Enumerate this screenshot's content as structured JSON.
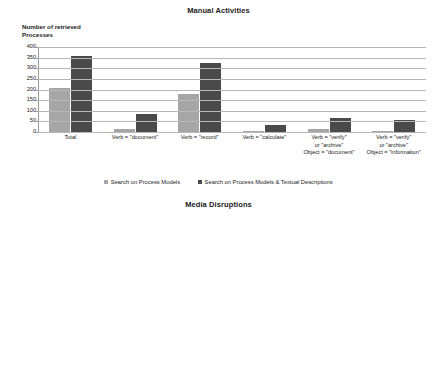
{
  "charts": [
    {
      "title": "Manual Activities",
      "y_caption": "Number of retrieved\nProcesses",
      "legend": [
        "Search on Process Models",
        "Search on Process Models & Textual Descriptions"
      ]
    },
    {
      "title": "Media Disruptions",
      "y_caption": "Number of retrieved\nProcesses",
      "legend": [
        "Search on Process Models",
        "Search on Process Models & Textual Descriptions"
      ]
    }
  ],
  "chart_data": [
    {
      "type": "bar",
      "title": "Manual Activities",
      "xlabel": "",
      "ylabel": "Number of retrieved Processes",
      "ylim": [
        0,
        400
      ],
      "yticks": [
        0,
        50,
        100,
        150,
        200,
        250,
        300,
        350,
        400
      ],
      "grid": true,
      "legend_position": "bottom",
      "categories": [
        "Total",
        "Verb = \"document\"",
        "Verb = \"record\"",
        "Verb = \"calculate\"",
        "Verb = \"verify\"\nor \"archive\"\nObject = \"document\"",
        "Verb = \"verify\"\nor \"archive\"\nObject = \"information\""
      ],
      "series": [
        {
          "name": "Search on Process Models",
          "color": "#a6a6a6",
          "values": [
            207,
            14,
            180,
            1,
            16,
            2
          ]
        },
        {
          "name": "Search on Process Models & Textual Descriptions",
          "color": "#4a4a4a",
          "values": [
            360,
            85,
            325,
            33,
            68,
            55
          ]
        }
      ]
    },
    {
      "type": "bar",
      "title": "Media Disruptions",
      "xlabel": "",
      "ylabel": "Number of retrieved Processes",
      "ylim": [
        0,
        160
      ],
      "yticks": [
        0,
        20,
        40,
        60,
        80,
        100,
        120,
        140,
        160
      ],
      "grid": true,
      "legend_position": "bottom",
      "categories": [
        "Total",
        "Verb = \"print\"",
        "Verb = \"scan\"",
        "Verb = \"enter\"\nObject = \"data\""
      ],
      "series": [
        {
          "name": "Search on Process Models",
          "color": "#a6a6a6",
          "values": [
            80,
            76,
            3,
            1
          ]
        },
        {
          "name": "Search on Process Models & Textual Descriptions",
          "color": "#4a4a4a",
          "values": [
            151,
            114,
            25,
            24
          ]
        }
      ]
    }
  ]
}
